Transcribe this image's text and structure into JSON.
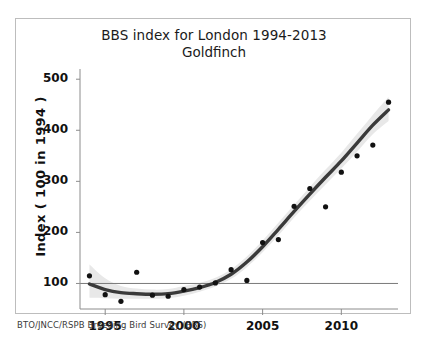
{
  "figure": {
    "caption": "BTO/JNCC/RSPB Breeding Bird Survey (BBS)",
    "frame_color": "#bdbdbd",
    "background": "#ffffff"
  },
  "chart_data": {
    "type": "scatter",
    "title": "BBS index for London 1994-2013",
    "subtitle": "Goldfinch",
    "xlabel": "",
    "ylabel": "Index ( 100 in 1994 )",
    "xlim": [
      1993.4,
      2013.6
    ],
    "ylim": [
      50,
      520
    ],
    "grid": false,
    "legend": null,
    "xticks": [
      1995,
      2000,
      2005,
      2010
    ],
    "xtick_labels": [
      "1995",
      "2000",
      "2005",
      "2010"
    ],
    "yticks": [
      100,
      200,
      300,
      400,
      500
    ],
    "ytick_labels": [
      "100",
      "200",
      "300",
      "400",
      "500"
    ],
    "reference_line": {
      "y": 100,
      "label": "baseline 100 in 1994",
      "color": "#7a7a7a"
    },
    "series": [
      {
        "name": "Annual index (points)",
        "type": "scatter",
        "marker": "circle",
        "color": "#111111",
        "x": [
          1994,
          1995,
          1996,
          1997,
          1998,
          1999,
          2000,
          2001,
          2002,
          2003,
          2004,
          2005,
          2006,
          2007,
          2008,
          2009,
          2010,
          2011,
          2012,
          2013
        ],
        "y": [
          115,
          78,
          65,
          122,
          77,
          75,
          88,
          93,
          101,
          127,
          106,
          180,
          186,
          251,
          286,
          250,
          318,
          350,
          371,
          455
        ]
      },
      {
        "name": "Smoothed trend",
        "type": "line",
        "color": "#3a3a3a",
        "x": [
          1994,
          1995,
          1996,
          1997,
          1998,
          1999,
          2000,
          2001,
          2002,
          2003,
          2004,
          2005,
          2006,
          2007,
          2008,
          2009,
          2010,
          2011,
          2012,
          2013
        ],
        "y": [
          99,
          88,
          82,
          80,
          79,
          80,
          85,
          92,
          102,
          118,
          142,
          172,
          206,
          241,
          275,
          308,
          340,
          375,
          410,
          440
        ]
      },
      {
        "name": "Confidence band",
        "type": "band",
        "color": "#e8e8e8",
        "x": [
          1994,
          1995,
          1996,
          1997,
          1998,
          1999,
          2000,
          2001,
          2002,
          2003,
          2004,
          2005,
          2006,
          2007,
          2008,
          2009,
          2010,
          2011,
          2012,
          2013
        ],
        "y_lower": [
          72,
          71,
          70,
          70,
          70,
          71,
          76,
          84,
          94,
          109,
          132,
          161,
          194,
          229,
          262,
          294,
          325,
          358,
          392,
          418
        ],
        "y_upper": [
          137,
          110,
          95,
          90,
          88,
          89,
          95,
          101,
          111,
          128,
          153,
          184,
          219,
          254,
          289,
          323,
          356,
          393,
          430,
          465
        ]
      }
    ]
  }
}
